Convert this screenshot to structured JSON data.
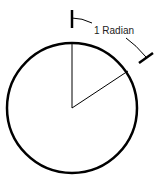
{
  "diagram": {
    "label": "1 Radian",
    "colors": {
      "stroke": "#000000",
      "text": "#222222",
      "background": "#ffffff"
    }
  }
}
